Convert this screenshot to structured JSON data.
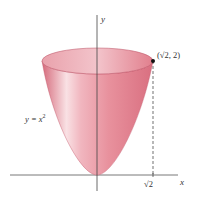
{
  "figure": {
    "axes": {
      "x_label": "x",
      "y_label": "y"
    },
    "labels": {
      "curve_eq_prefix": "y = ",
      "curve_eq_var": "x",
      "curve_eq_exp": "2",
      "point": "(√2, 2)",
      "x_tick": "√2"
    },
    "colors": {
      "surface_light": "#f7d3d8",
      "surface_mid": "#e8909c",
      "surface_dark": "#d56a7b",
      "top_ellipse": "#e48a97",
      "axis": "#555555",
      "point": "#111111"
    }
  }
}
